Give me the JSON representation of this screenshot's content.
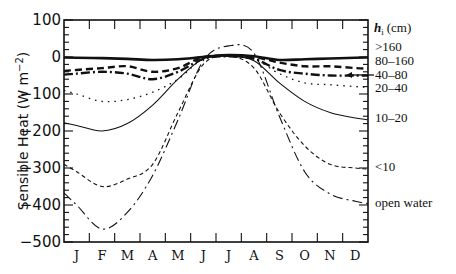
{
  "chart_data": {
    "type": "line",
    "title": "",
    "xlabel": "",
    "ylabel": "Sensible Heat (W m^-2)",
    "ylabel_parts": {
      "main": "Sensible Heat (W m",
      "sup": "−2",
      "close": ")"
    },
    "ylim": [
      -500,
      100
    ],
    "yticks": [
      100,
      0,
      -100,
      -200,
      -300,
      -400,
      -500
    ],
    "ytick_labels": [
      "100",
      "0",
      "−100",
      "−200",
      "−300",
      "−400",
      "−500"
    ],
    "categories": [
      "J",
      "F",
      "M",
      "A",
      "M",
      "J",
      "J",
      "A",
      "S",
      "O",
      "N",
      "D"
    ],
    "grid": false,
    "legend_title": "h_i (cm)",
    "legend_title_parts": {
      "var": "h",
      "sub": "i",
      "unit": "(cm)"
    },
    "legend_position": "right",
    "series": [
      {
        "name": ">160",
        "style": "solid-thick",
        "values": [
          -2,
          -3,
          -5,
          -8,
          -6,
          0,
          5,
          2,
          -8,
          -6,
          -4,
          -2
        ]
      },
      {
        "name": "80–160",
        "style": "dashed-thick",
        "values": [
          -35,
          -30,
          -25,
          -40,
          -30,
          0,
          3,
          0,
          -15,
          -25,
          -25,
          -30
        ]
      },
      {
        "name": "40–80",
        "style": "dash-dot-thick",
        "values": [
          -45,
          -40,
          -45,
          -60,
          -40,
          -5,
          2,
          -5,
          -35,
          -45,
          -50,
          -50
        ]
      },
      {
        "name": "20–40",
        "style": "dotted",
        "values": [
          -100,
          -120,
          -115,
          -95,
          -60,
          -5,
          2,
          -5,
          -45,
          -70,
          -75,
          -80
        ]
      },
      {
        "name": "10–20",
        "style": "solid-thin",
        "values": [
          -185,
          -200,
          -180,
          -130,
          -60,
          -5,
          2,
          -10,
          -70,
          -120,
          -150,
          -165
        ]
      },
      {
        "name": "<10",
        "style": "dashed-thin",
        "values": [
          -310,
          -350,
          -330,
          -290,
          -150,
          -20,
          2,
          -30,
          -150,
          -240,
          -290,
          -300
        ]
      },
      {
        "name": "open water",
        "style": "dash-dot-thin",
        "values": [
          -400,
          -465,
          -420,
          -320,
          -170,
          -10,
          30,
          10,
          -160,
          -310,
          -370,
          -390
        ]
      }
    ]
  }
}
